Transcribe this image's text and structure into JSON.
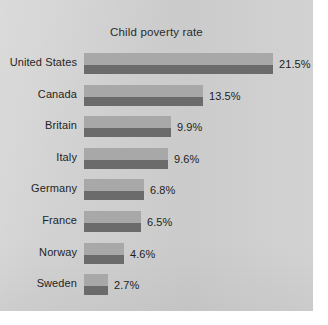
{
  "chart_data": {
    "type": "bar",
    "orientation": "horizontal",
    "title": "Child poverty rate",
    "xlabel": "",
    "ylabel": "",
    "categories": [
      "United States",
      "Canada",
      "Britain",
      "Italy",
      "Germany",
      "France",
      "Norway",
      "Sweden"
    ],
    "values": [
      21.5,
      13.5,
      9.9,
      9.6,
      6.8,
      6.5,
      4.6,
      2.7
    ],
    "value_labels": [
      "21.5%",
      "13.5%",
      "9.9%",
      "9.6%",
      "6.8%",
      "6.5%",
      "4.6%",
      "2.7%"
    ],
    "xlim": [
      0,
      21.5
    ],
    "grid": false,
    "legend": null,
    "units": "percent",
    "rows": [
      {
        "label": "United States",
        "value": 21.5,
        "value_label": "21.5%"
      },
      {
        "label": "Canada",
        "value": 13.5,
        "value_label": "13.5%"
      },
      {
        "label": "Britain",
        "value": 9.9,
        "value_label": "9.9%"
      },
      {
        "label": "Italy",
        "value": 9.6,
        "value_label": "9.6%"
      },
      {
        "label": "Germany",
        "value": 6.8,
        "value_label": "6.8%"
      },
      {
        "label": "France",
        "value": 6.5,
        "value_label": "6.5%"
      },
      {
        "label": "Norway",
        "value": 4.6,
        "value_label": "4.6%"
      },
      {
        "label": "Sweden",
        "value": 2.7,
        "value_label": "2.7%"
      }
    ]
  },
  "style": {
    "panel_background": "#cfcfcf",
    "page_background": "#ffffff",
    "bar_light": "#a8a8a8",
    "bar_dark": "#6b6b6b",
    "text_color": "#1f1f1f",
    "title_color": "#2b2b2b"
  },
  "layout": {
    "bar_origin_x": 84,
    "pixels_per_unit": 8.8,
    "row_pitch": 31.6
  }
}
